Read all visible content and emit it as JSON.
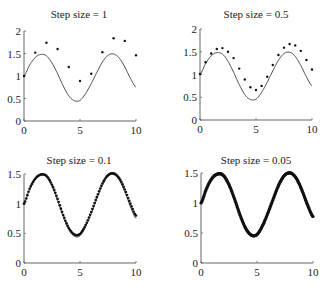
{
  "chart_data": [
    {
      "type": "line",
      "title": "Step size = 1",
      "xlabel": "",
      "ylabel": "",
      "xlim": [
        0,
        10
      ],
      "ylim": [
        0,
        2
      ],
      "xticks": [
        "0",
        "5",
        "10"
      ],
      "yticks": [
        "0",
        "0.5",
        "1",
        "1.5",
        "2"
      ],
      "grid": false,
      "legend": null,
      "series": [
        {
          "name": "exact",
          "style": "line",
          "x": [
            0,
            0.5,
            1,
            1.5,
            2,
            2.5,
            3,
            3.5,
            4,
            4.5,
            5,
            5.5,
            6,
            6.5,
            7,
            7.5,
            8,
            8.5,
            9,
            9.5,
            10
          ],
          "values": [
            1.0,
            1.24,
            1.41,
            1.48,
            1.45,
            1.29,
            1.05,
            0.78,
            0.56,
            0.45,
            0.46,
            0.61,
            0.83,
            1.08,
            1.31,
            1.46,
            1.49,
            1.4,
            1.2,
            0.95,
            0.75
          ]
        },
        {
          "name": "euler h=1",
          "style": "dots",
          "x": [
            0,
            1,
            2,
            3,
            4,
            5,
            6,
            7,
            8,
            9,
            10
          ],
          "values": [
            1.0,
            1.52,
            1.74,
            1.6,
            1.2,
            0.89,
            1.05,
            1.53,
            1.84,
            1.78,
            1.46
          ]
        }
      ]
    },
    {
      "type": "line",
      "title": "Step size = 0.5",
      "xlabel": "",
      "ylabel": "",
      "xlim": [
        0,
        10
      ],
      "ylim": [
        0,
        2
      ],
      "xticks": [
        "0",
        "5",
        "10"
      ],
      "yticks": [
        "0",
        "0.5",
        "1",
        "1.5",
        "2"
      ],
      "grid": false,
      "legend": null,
      "series": [
        {
          "name": "exact",
          "style": "line",
          "x": [
            0,
            0.5,
            1,
            1.5,
            2,
            2.5,
            3,
            3.5,
            4,
            4.5,
            5,
            5.5,
            6,
            6.5,
            7,
            7.5,
            8,
            8.5,
            9,
            9.5,
            10
          ],
          "values": [
            1.0,
            1.24,
            1.41,
            1.48,
            1.45,
            1.29,
            1.05,
            0.78,
            0.56,
            0.45,
            0.46,
            0.61,
            0.83,
            1.08,
            1.31,
            1.46,
            1.49,
            1.4,
            1.2,
            0.95,
            0.75
          ]
        },
        {
          "name": "euler h=0.5",
          "style": "dots",
          "x": [
            0,
            0.5,
            1,
            1.5,
            2,
            2.5,
            3,
            3.5,
            4,
            4.5,
            5,
            5.5,
            6,
            6.5,
            7,
            7.5,
            8,
            8.5,
            9,
            9.5,
            10
          ],
          "values": [
            1.01,
            1.27,
            1.46,
            1.56,
            1.58,
            1.5,
            1.36,
            1.13,
            0.89,
            0.72,
            0.66,
            0.75,
            0.95,
            1.21,
            1.43,
            1.59,
            1.67,
            1.64,
            1.52,
            1.32,
            1.11
          ]
        }
      ]
    },
    {
      "type": "line",
      "title": "Step size = 0.1",
      "xlabel": "",
      "ylabel": "",
      "xlim": [
        0,
        10
      ],
      "ylim": [
        0,
        1.5
      ],
      "xticks": [
        "0",
        "5",
        "10"
      ],
      "yticks": [
        "0",
        "0.5",
        "1",
        "1.5"
      ],
      "grid": false,
      "legend": null,
      "series": [
        {
          "name": "exact",
          "style": "line",
          "x": [
            0,
            0.5,
            1,
            1.5,
            2,
            2.5,
            3,
            3.5,
            4,
            4.5,
            5,
            5.5,
            6,
            6.5,
            7,
            7.5,
            8,
            8.5,
            9,
            9.5,
            10
          ],
          "values": [
            1.0,
            1.24,
            1.41,
            1.48,
            1.45,
            1.29,
            1.05,
            0.78,
            0.56,
            0.45,
            0.46,
            0.61,
            0.83,
            1.08,
            1.31,
            1.46,
            1.49,
            1.4,
            1.2,
            0.95,
            0.75
          ]
        },
        {
          "name": "euler h=0.1",
          "style": "dots",
          "step": 0.1,
          "x": [
            0,
            0.5,
            1,
            1.5,
            2,
            2.5,
            3,
            3.5,
            4,
            4.5,
            5,
            5.5,
            6,
            6.5,
            7,
            7.5,
            8,
            8.5,
            9,
            9.5,
            10
          ],
          "values": [
            1.0,
            1.25,
            1.42,
            1.49,
            1.47,
            1.32,
            1.08,
            0.81,
            0.59,
            0.48,
            0.49,
            0.64,
            0.86,
            1.11,
            1.34,
            1.48,
            1.51,
            1.43,
            1.24,
            1.0,
            0.8
          ]
        }
      ]
    },
    {
      "type": "line",
      "title": "Step size = 0.05",
      "xlabel": "",
      "ylabel": "",
      "xlim": [
        0,
        10
      ],
      "ylim": [
        0,
        1.5
      ],
      "xticks": [
        "0",
        "5",
        "10"
      ],
      "yticks": [
        "0",
        "0.5",
        "1",
        "1.5"
      ],
      "grid": false,
      "legend": null,
      "series": [
        {
          "name": "exact",
          "style": "line",
          "x": [
            0,
            0.5,
            1,
            1.5,
            2,
            2.5,
            3,
            3.5,
            4,
            4.5,
            5,
            5.5,
            6,
            6.5,
            7,
            7.5,
            8,
            8.5,
            9,
            9.5,
            10
          ],
          "values": [
            1.0,
            1.24,
            1.41,
            1.48,
            1.45,
            1.29,
            1.05,
            0.78,
            0.56,
            0.45,
            0.46,
            0.61,
            0.83,
            1.08,
            1.31,
            1.46,
            1.49,
            1.4,
            1.2,
            0.95,
            0.75
          ]
        },
        {
          "name": "euler h=0.05",
          "style": "dots",
          "step": 0.05,
          "x": [
            0,
            0.5,
            1,
            1.5,
            2,
            2.5,
            3,
            3.5,
            4,
            4.5,
            5,
            5.5,
            6,
            6.5,
            7,
            7.5,
            8,
            8.5,
            9,
            9.5,
            10
          ],
          "values": [
            1.0,
            1.245,
            1.415,
            1.485,
            1.46,
            1.305,
            1.065,
            0.795,
            0.575,
            0.465,
            0.475,
            0.625,
            0.845,
            1.095,
            1.325,
            1.47,
            1.5,
            1.415,
            1.22,
            0.975,
            0.775
          ]
        }
      ]
    }
  ]
}
